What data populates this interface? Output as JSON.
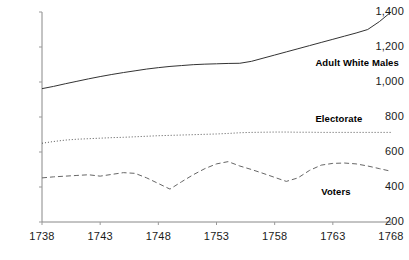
{
  "chart_data": {
    "type": "line",
    "title": "",
    "subtitle": "",
    "xlabel": "",
    "ylabel": "",
    "grid": false,
    "legend_position": "inline-right",
    "xlim": [
      1738,
      1768
    ],
    "ylim": [
      200,
      1400
    ],
    "x_tick_labels": [
      "1738",
      "1743",
      "1748",
      "1753",
      "1758",
      "1763",
      "1768"
    ],
    "x_ticks": [
      1738,
      1743,
      1748,
      1753,
      1758,
      1763,
      1768
    ],
    "y_tick_labels": [
      "200",
      "400",
      "600",
      "800",
      "1,000",
      "1,200",
      "1,400"
    ],
    "y_ticks": [
      200,
      400,
      600,
      800,
      1000,
      1200,
      1400
    ],
    "x": [
      1738,
      1739,
      1740,
      1741,
      1742,
      1743,
      1744,
      1745,
      1746,
      1747,
      1748,
      1749,
      1750,
      1751,
      1752,
      1753,
      1754,
      1755,
      1756,
      1757,
      1758,
      1759,
      1760,
      1761,
      1762,
      1763,
      1764,
      1765,
      1766,
      1767,
      1768
    ],
    "series": [
      {
        "name": "Adult White Males",
        "style": "solid",
        "color": "#333333",
        "label_x": 1761.5,
        "label_y": 1110,
        "values": [
          962,
          975,
          990,
          1004,
          1018,
          1031,
          1043,
          1054,
          1064,
          1074,
          1082,
          1089,
          1094,
          1099,
          1102,
          1104,
          1106,
          1107,
          1118,
          1136,
          1154,
          1172,
          1190,
          1208,
          1226,
          1244,
          1262,
          1280,
          1300,
          1345,
          1400
        ]
      },
      {
        "name": "Electorate",
        "style": "dotted",
        "color": "#555555",
        "label_x": 1761.5,
        "label_y": 790,
        "values": [
          650,
          660,
          668,
          673,
          676,
          679,
          682,
          684,
          687,
          690,
          693,
          695,
          697,
          699,
          701,
          703,
          706,
          710,
          712,
          713,
          714,
          714,
          713,
          713,
          712,
          712,
          712,
          712,
          712,
          712,
          712
        ]
      },
      {
        "name": "Voters",
        "style": "dashed",
        "color": "#666666",
        "label_x": 1762.0,
        "label_y": 370,
        "values": [
          452,
          458,
          462,
          466,
          470,
          462,
          472,
          482,
          478,
          452,
          420,
          388,
          430,
          470,
          505,
          532,
          545,
          520,
          500,
          478,
          455,
          432,
          452,
          495,
          525,
          535,
          537,
          532,
          520,
          505,
          490
        ]
      }
    ],
    "annotations": []
  }
}
